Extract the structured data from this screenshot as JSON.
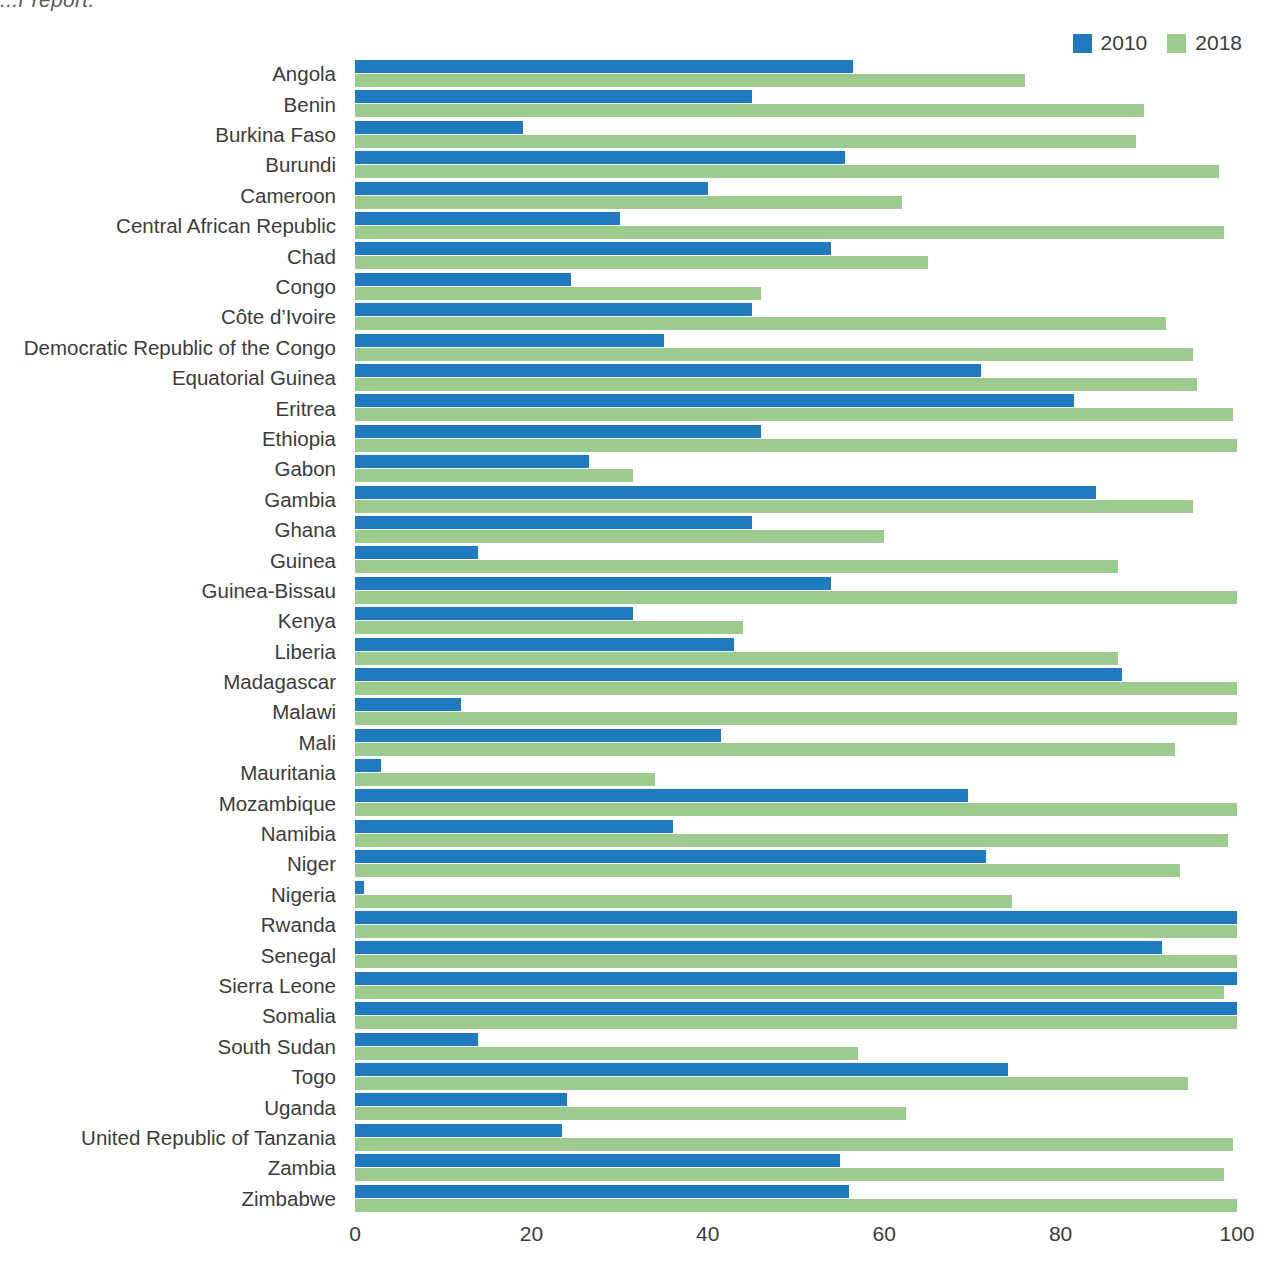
{
  "partial_title": "...r report.",
  "legend": {
    "position": "top-right",
    "entries": [
      {
        "label": "2010",
        "color": "#1f7ac0"
      },
      {
        "label": "2018",
        "color": "#9ccb8f"
      }
    ]
  },
  "colors": {
    "series_2010": "#1f7ac0",
    "series_2018": "#9ccb8f",
    "text": "#3c3c3c",
    "background": "#ffffff"
  },
  "axis": {
    "x_ticks": [
      "0",
      "20",
      "40",
      "60",
      "80",
      "100"
    ],
    "x_tick_values": [
      0,
      20,
      40,
      60,
      80,
      100
    ],
    "xlim": [
      0,
      100
    ],
    "grid": false
  },
  "chart_data": {
    "type": "bar",
    "orientation": "horizontal",
    "title": "",
    "xlabel": "",
    "ylabel": "",
    "xlim": [
      0,
      100
    ],
    "grid": false,
    "legend_position": "top-right",
    "categories": [
      "Angola",
      "Benin",
      "Burkina Faso",
      "Burundi",
      "Cameroon",
      "Central African Republic",
      "Chad",
      "Congo",
      "Côte d’Ivoire",
      "Democratic Republic of the Congo",
      "Equatorial Guinea",
      "Eritrea",
      "Ethiopia",
      "Gabon",
      "Gambia",
      "Ghana",
      "Guinea",
      "Guinea-Bissau",
      "Kenya",
      "Liberia",
      "Madagascar",
      "Malawi",
      "Mali",
      "Mauritania",
      "Mozambique",
      "Namibia",
      "Niger",
      "Nigeria",
      "Rwanda",
      "Senegal",
      "Sierra Leone",
      "Somalia",
      "South Sudan",
      "Togo",
      "Uganda",
      "United Republic of Tanzania",
      "Zambia",
      "Zimbabwe"
    ],
    "series": [
      {
        "name": "2010",
        "color": "#1f7ac0",
        "values": [
          56.5,
          45.0,
          19.0,
          55.5,
          40.0,
          30.0,
          54.0,
          24.5,
          45.0,
          35.0,
          71.0,
          81.5,
          46.0,
          26.5,
          84.0,
          45.0,
          14.0,
          54.0,
          31.5,
          43.0,
          87.0,
          12.0,
          41.5,
          3.0,
          69.5,
          36.0,
          71.5,
          1.0,
          100.0,
          91.5,
          100.0,
          100.0,
          14.0,
          74.0,
          24.0,
          23.5,
          55.0,
          56.0
        ]
      },
      {
        "name": "2018",
        "color": "#9ccb8f",
        "values": [
          76.0,
          89.5,
          88.5,
          98.0,
          62.0,
          98.5,
          65.0,
          46.0,
          92.0,
          95.0,
          95.5,
          99.5,
          100.0,
          31.5,
          95.0,
          60.0,
          86.5,
          100.0,
          44.0,
          86.5,
          100.0,
          100.0,
          93.0,
          34.0,
          100.0,
          99.0,
          93.5,
          74.5,
          100.0,
          100.0,
          98.5,
          100.0,
          57.0,
          94.5,
          62.5,
          99.5,
          98.5,
          100.0
        ]
      }
    ]
  }
}
